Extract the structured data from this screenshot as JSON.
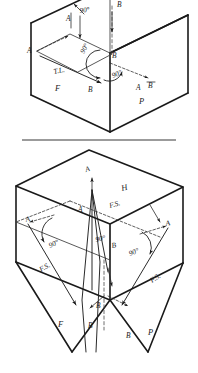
{
  "figure": {
    "background_color": "#ffffff",
    "line_color": "#1a1a1a",
    "divider_color": "#7a7a7a",
    "width": 198,
    "height": 373
  },
  "upper_diagram": {
    "name": "true-length-line-glass-box",
    "description": "Isometric glass box showing line AB projected as true length on the frontal plane",
    "plane_labels": {
      "frontal": "F",
      "profile": "P",
      "horizontal_trace": "T.L."
    },
    "point_labels": {
      "a_top": "A",
      "a_left": "A",
      "b_top": "B",
      "b_center": "B",
      "b_front": "B",
      "a_profile": "A",
      "b_profile": "B"
    },
    "angle_labels": {
      "top_right": "90°",
      "center_left": "90°",
      "center_lower": "90°"
    },
    "true_length_label": "T.L."
  },
  "lower_diagram": {
    "name": "point-view-folding-line-glass-box",
    "description": "Isometric glass box showing successive auxiliary views with folding lines at 90 degrees",
    "plane_labels": {
      "horizontal": "H",
      "frontal": "F",
      "profile": "P"
    },
    "fold_labels": {
      "top": "F.S.",
      "left": "F.S.",
      "right": "F.S."
    },
    "point_labels": {
      "a_top": "A",
      "a_center": "A",
      "a_left": "A",
      "a_right": "A",
      "b_center": "B",
      "b_lower_center": "B",
      "b_left": "B",
      "b_right": "B"
    },
    "angle_labels": {
      "left": "90°",
      "center": "90°",
      "right": "90°"
    }
  }
}
